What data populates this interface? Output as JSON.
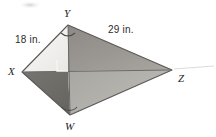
{
  "figure": {
    "kind": "geometry-diagram",
    "shape_name": "kite",
    "width": 216,
    "height": 137,
    "background_color": "#ffffff"
  },
  "vertices": [
    {
      "id": "Y",
      "label": "Y",
      "x": 68,
      "y": 25,
      "label_x": 64,
      "label_y": 8
    },
    {
      "id": "X",
      "label": "X",
      "x": 22,
      "y": 72,
      "label_x": 8,
      "label_y": 66
    },
    {
      "id": "Z",
      "label": "Z",
      "x": 172,
      "y": 70,
      "label_x": 178,
      "label_y": 73
    },
    {
      "id": "W",
      "label": "W",
      "x": 70,
      "y": 115,
      "label_x": 65,
      "label_y": 121
    }
  ],
  "center_point": {
    "x": 68,
    "y": 71
  },
  "measurements": [
    {
      "id": "side-xy",
      "text": "18 in.",
      "segment": "XY",
      "label_x": 15,
      "label_y": 35
    },
    {
      "id": "side-yz",
      "text": "29 in.",
      "segment": "YZ",
      "label_x": 108,
      "label_y": 25
    }
  ],
  "markings": {
    "right_angle": {
      "present": true,
      "at": "center",
      "size": 11
    },
    "angle_arc_y": {
      "present": true,
      "at": "Y"
    },
    "angle_arc_w": {
      "present": true,
      "at": "W"
    },
    "smudge_top_left": {
      "present": true
    },
    "faint_line_right_of_z": {
      "present": true
    }
  },
  "regions": [
    {
      "id": "upper-left",
      "triangle": "X-Y-center",
      "fill": "#f2f0ee"
    },
    {
      "id": "upper-right",
      "triangle": "Y-Z-center",
      "fill": "#999691"
    },
    {
      "id": "lower-left",
      "triangle": "X-W-center",
      "fill": "#6e6c6a"
    },
    {
      "id": "lower-right",
      "triangle": "W-Z-center",
      "fill": "#b0aeaa"
    }
  ],
  "colors": {
    "outline": "#5a5856",
    "diagonal": "#6b6967",
    "text": "#232323",
    "measure_text": "#2b2b2b",
    "right_angle_stroke": "#f7f6f4",
    "arc_stroke": "#4e4c4a"
  }
}
